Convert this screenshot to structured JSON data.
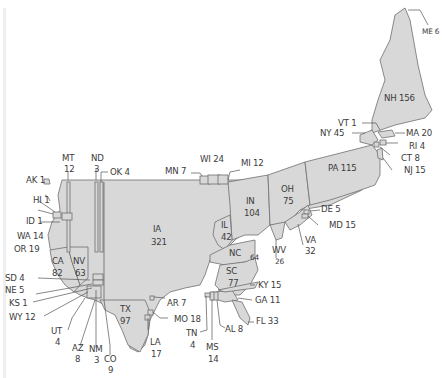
{
  "map": {
    "type": "cartogram",
    "fill_color": "#d8d8d8",
    "stroke_color": "#6e6e6e",
    "text_color": "#3c3c3c",
    "states": [
      {
        "code": "ME",
        "value": 6,
        "label": "ME 6"
      },
      {
        "code": "NH",
        "value": 156,
        "label": "NH 156"
      },
      {
        "code": "VT",
        "value": 1,
        "label": "VT 1"
      },
      {
        "code": "NY",
        "value": 45,
        "label": "NY 45"
      },
      {
        "code": "MA",
        "value": 20,
        "label": "MA 20"
      },
      {
        "code": "RI",
        "value": 4,
        "label": "RI 4"
      },
      {
        "code": "CT",
        "value": 8,
        "label": "CT 8"
      },
      {
        "code": "NJ",
        "value": 15,
        "label": "NJ 15"
      },
      {
        "code": "PA",
        "value": 115,
        "label": "PA 115"
      },
      {
        "code": "DE",
        "value": 5,
        "label": "DE 5"
      },
      {
        "code": "MD",
        "value": 15,
        "label": "MD 15"
      },
      {
        "code": "VA",
        "value": 32,
        "label": "VA",
        "value_label": "32"
      },
      {
        "code": "WV",
        "value": 26,
        "label": "WV",
        "value_label": "26"
      },
      {
        "code": "OH",
        "value": 75,
        "label": "OH",
        "value_label": "75"
      },
      {
        "code": "IN",
        "value": 104,
        "label": "IN",
        "value_label": "104"
      },
      {
        "code": "MI",
        "value": 12,
        "label": "MI 12"
      },
      {
        "code": "WI",
        "value": 24,
        "label": "WI 24"
      },
      {
        "code": "MN",
        "value": 7,
        "label": "MN 7"
      },
      {
        "code": "IA",
        "value": 321,
        "label": "IA",
        "value_label": "321"
      },
      {
        "code": "IL",
        "value": 42,
        "label": "IL",
        "value_label": "42"
      },
      {
        "code": "NC",
        "value": 64,
        "label": "NC",
        "value_label": "64"
      },
      {
        "code": "SC",
        "value": 77,
        "label": "SC",
        "value_label": "77"
      },
      {
        "code": "KY",
        "value": 15,
        "label": "KY 15"
      },
      {
        "code": "GA",
        "value": 11,
        "label": "GA 11"
      },
      {
        "code": "FL",
        "value": 33,
        "label": "FL 33"
      },
      {
        "code": "AL",
        "value": 8,
        "label": "AL 8"
      },
      {
        "code": "MS",
        "value": 14,
        "label": "MS",
        "value_label": "14"
      },
      {
        "code": "TN",
        "value": 4,
        "label": "TN",
        "value_label": "4"
      },
      {
        "code": "MO",
        "value": 18,
        "label": "MO 18"
      },
      {
        "code": "AR",
        "value": 7,
        "label": "AR 7"
      },
      {
        "code": "LA",
        "value": 17,
        "label": "LA",
        "value_label": "17"
      },
      {
        "code": "TX",
        "value": 97,
        "label": "TX",
        "value_label": "97"
      },
      {
        "code": "CO",
        "value": 9,
        "label": "CO",
        "value_label": "9"
      },
      {
        "code": "NM",
        "value": 3,
        "label": "NM",
        "value_label": "3"
      },
      {
        "code": "AZ",
        "value": 8,
        "label": "AZ",
        "value_label": "8"
      },
      {
        "code": "UT",
        "value": 4,
        "label": "UT",
        "value_label": "4"
      },
      {
        "code": "WY",
        "value": 12,
        "label": "WY 12"
      },
      {
        "code": "KS",
        "value": 1,
        "label": "KS 1"
      },
      {
        "code": "NE",
        "value": 5,
        "label": "NE 5"
      },
      {
        "code": "SD",
        "value": 4,
        "label": "SD 4"
      },
      {
        "code": "CA",
        "value": 82,
        "label": "CA",
        "value_label": "82"
      },
      {
        "code": "NV",
        "value": 63,
        "label": "NV",
        "value_label": "63"
      },
      {
        "code": "OR",
        "value": 19,
        "label": "OR 19"
      },
      {
        "code": "WA",
        "value": 14,
        "label": "WA 14"
      },
      {
        "code": "ID",
        "value": 1,
        "label": "ID 1"
      },
      {
        "code": "AK",
        "value": 1,
        "label": "AK 1"
      },
      {
        "code": "HI",
        "value": 1,
        "label": "HI 1"
      },
      {
        "code": "MT",
        "value": 12,
        "label": "MT",
        "value_label": "12"
      },
      {
        "code": "ND",
        "value": 3,
        "label": "ND",
        "value_label": "3"
      },
      {
        "code": "OK",
        "value": 4,
        "label": "OK 4"
      }
    ]
  }
}
